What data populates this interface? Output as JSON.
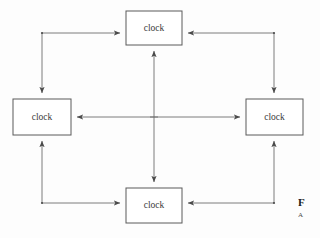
{
  "figure": {
    "background_color": "#fdfdfd",
    "line_color": "#6e6e6e",
    "box_stroke_color": "#5a5a5a",
    "box_fill_color": "#ffffff",
    "text_color": "#3a3a3a",
    "width": 320,
    "height": 238
  },
  "nodes": [
    {
      "id": "top",
      "label": "clock",
      "x": 126,
      "y": 11,
      "w": 56,
      "h": 34
    },
    {
      "id": "left",
      "label": "clock",
      "x": 13,
      "y": 99,
      "w": 58,
      "h": 36
    },
    {
      "id": "right",
      "label": "clock",
      "x": 246,
      "y": 99,
      "w": 57,
      "h": 36
    },
    {
      "id": "bottom",
      "label": "clock",
      "x": 126,
      "y": 188,
      "w": 56,
      "h": 35
    }
  ],
  "center_links": [
    {
      "id": "vertical-center",
      "from": "top",
      "to": "bottom",
      "direction": "bidirectional",
      "orientation": "vertical"
    },
    {
      "id": "horizontal-center",
      "from": "left",
      "to": "right",
      "direction": "bidirectional",
      "orientation": "horizontal"
    }
  ],
  "perimeter_links": [
    {
      "id": "top-left-path",
      "from": "left",
      "to": "top",
      "direction": "bidirectional",
      "corner": "top-left"
    },
    {
      "id": "top-right-path",
      "from": "right",
      "to": "top",
      "direction": "bidirectional",
      "corner": "top-right"
    },
    {
      "id": "bottom-left-path",
      "from": "bottom",
      "to": "left",
      "direction": "bidirectional",
      "corner": "bottom-left"
    },
    {
      "id": "bottom-right-path",
      "from": "bottom",
      "to": "right",
      "direction": "bidirectional",
      "corner": "bottom-right"
    }
  ],
  "caption": {
    "line_1": "F",
    "line_2": "A"
  }
}
